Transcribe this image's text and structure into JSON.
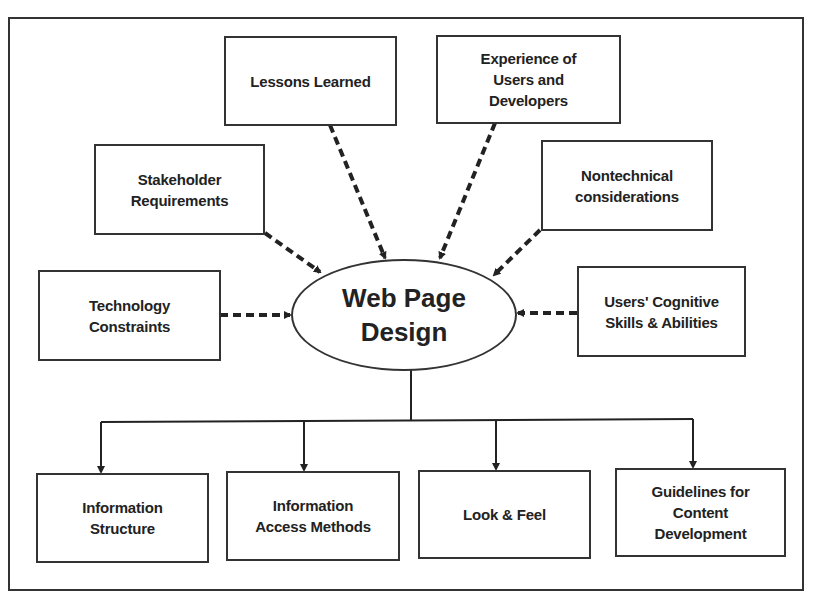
{
  "diagram": {
    "center": {
      "label": "Web Page\nDesign"
    },
    "inputs": [
      {
        "id": "lessons",
        "label": "Lessons Learned"
      },
      {
        "id": "experience",
        "label": "Experience of\nUsers and\nDevelopers"
      },
      {
        "id": "stakeholder",
        "label": "Stakeholder\nRequirements"
      },
      {
        "id": "nontechnical",
        "label": "Nontechnical\nconsiderations"
      },
      {
        "id": "technology",
        "label": "Technology\nConstraints"
      },
      {
        "id": "cognitive",
        "label": "Users' Cognitive\nSkills & Abilities"
      }
    ],
    "outputs": [
      {
        "id": "info-structure",
        "label": "Information\nStructure"
      },
      {
        "id": "info-access",
        "label": "Information\nAccess Methods"
      },
      {
        "id": "look-feel",
        "label": "Look & Feel"
      },
      {
        "id": "guidelines",
        "label": "Guidelines for\nContent\nDevelopment"
      }
    ],
    "edges": {
      "inputs_style": "dashed, pointing into center",
      "outputs_style": "solid tree with arrows pointing down"
    }
  }
}
